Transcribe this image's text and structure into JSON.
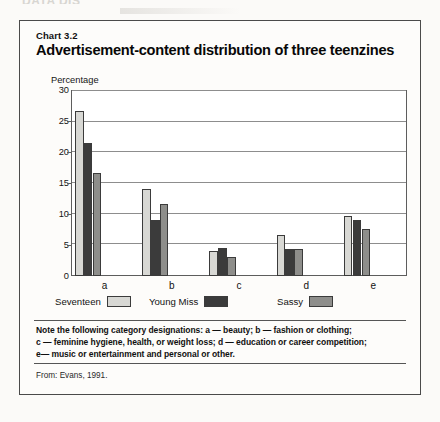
{
  "page": {
    "bleed_text": "DATA DIS"
  },
  "figure": {
    "chart_number": "Chart 3.2",
    "title": "Advertisement-content distribution of three teenzines",
    "source": "From: Evans, 1991.",
    "note_lines": [
      "Note the following category designations: a — beauty; b — fashion or clothing;",
      "c — feminine hygiene, health, or weight loss; d — education or career competition;",
      "e— music or entertainment and personal or other."
    ]
  },
  "legend": [
    {
      "label": "Seventeen",
      "color": "#d8d8d4"
    },
    {
      "label": "Young Miss",
      "color": "#3b3b3b"
    },
    {
      "label": "Sassy",
      "color": "#8e8e8b"
    }
  ],
  "chart_data": {
    "type": "bar",
    "title": "Advertisement-content distribution of three teenzines",
    "xlabel": "",
    "ylabel": "Percentage",
    "ylim": [
      0,
      30
    ],
    "yticks": [
      0,
      5,
      10,
      15,
      20,
      25,
      30
    ],
    "ytick_labels": [
      "0",
      "5",
      "10",
      "15",
      "20",
      "25",
      "30"
    ],
    "grid": true,
    "legend_position": "bottom",
    "categories": [
      "a",
      "b",
      "c",
      "d",
      "e"
    ],
    "category_descriptions": [
      "beauty",
      "fashion or clothing",
      "feminine hygiene, health, or weight loss",
      "education or career competition",
      "music or entertainment and personal or other"
    ],
    "series": [
      {
        "name": "Seventeen",
        "color": "#d8d8d4",
        "values": [
          26.6,
          14.0,
          4.0,
          6.6,
          9.6
        ]
      },
      {
        "name": "Young Miss",
        "color": "#3b3b3b",
        "values": [
          21.4,
          9.0,
          4.5,
          4.4,
          9.0
        ]
      },
      {
        "name": "Sassy",
        "color": "#8e8e8b",
        "values": [
          16.6,
          11.6,
          3.0,
          4.4,
          7.6
        ]
      }
    ]
  }
}
